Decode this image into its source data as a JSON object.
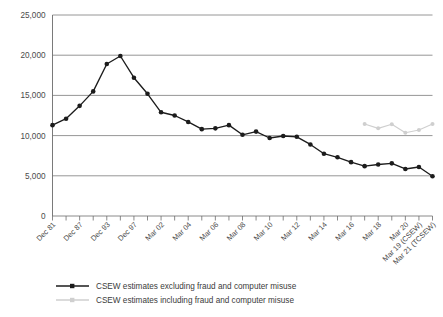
{
  "chart_data": {
    "type": "line",
    "title": "",
    "xlabel": "",
    "ylabel": "",
    "ylim": [
      0,
      25000
    ],
    "ytick_values": [
      0,
      5000,
      10000,
      15000,
      20000,
      25000
    ],
    "ytick_labels": [
      "0",
      "5,000",
      "10,000",
      "15,000",
      "20,000",
      "25,000"
    ],
    "grid": true,
    "grid_axis": "y",
    "legend_position": "bottom",
    "x": [
      "Dec 81",
      "Dec 83",
      "Dec 87",
      "Dec 91",
      "Dec 93",
      "Dec 95",
      "Dec 97",
      "Dec 99",
      "Mar 02",
      "Mar 03",
      "Mar 04",
      "Mar 05",
      "Mar 06",
      "Mar 07",
      "Mar 08",
      "Mar 09",
      "Mar 10",
      "Mar 11",
      "Mar 12",
      "Mar 13",
      "Mar 14",
      "Mar 15",
      "Mar 16",
      "Mar 17",
      "Mar 18",
      "Mar 19",
      "Mar 20",
      "Mar 19 (CSEW)",
      "Mar 21 (TCSEW)"
    ],
    "xtick_labels_shown": [
      "Dec 81",
      "Dec 87",
      "Dec 93",
      "Dec 97",
      "Mar 02",
      "Mar 04",
      "Mar 06",
      "Mar 08",
      "Mar 10",
      "Mar 12",
      "Mar 14",
      "Mar 16",
      "Mar 18",
      "Mar 20",
      "Mar 19 (CSEW)",
      "Mar 21 (TCSEW)"
    ],
    "series": [
      {
        "name": "CSEW estimates excluding fraud and computer misuse",
        "color": "#1c1c1c",
        "marker": "circle",
        "values": [
          11300,
          12100,
          13700,
          15500,
          18900,
          19900,
          17200,
          15200,
          12900,
          12500,
          11700,
          10800,
          10900,
          11300,
          10100,
          10500,
          9700,
          9950,
          9850,
          8900,
          7750,
          7300,
          6700,
          6200,
          6400,
          6550,
          5850,
          6100,
          4950
        ]
      },
      {
        "name": "CSEW estimates including fraud and computer misuse",
        "color": "#cfcfcf",
        "marker": "circle",
        "values": [
          null,
          null,
          null,
          null,
          null,
          null,
          null,
          null,
          null,
          null,
          null,
          null,
          null,
          null,
          null,
          null,
          null,
          null,
          null,
          null,
          null,
          null,
          null,
          11450,
          10900,
          11400,
          10350,
          10700,
          11450
        ]
      }
    ]
  },
  "legend": {
    "items": [
      {
        "label": "CSEW estimates excluding fraud and computer misuse",
        "color": "#1c1c1c"
      },
      {
        "label": "CSEW estimates including fraud and computer misuse",
        "color": "#cfcfcf"
      }
    ]
  },
  "colors": {
    "axis": "#6b6b6b",
    "grid": "#8a8a8a",
    "series_dark": "#1c1c1c",
    "series_light": "#cfcfcf",
    "text": "#4a4a4a",
    "background": "#ffffff"
  }
}
